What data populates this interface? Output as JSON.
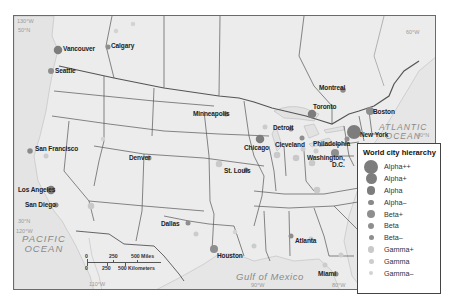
{
  "map": {
    "oceans": [
      {
        "id": "pacific",
        "line1": "PACIFIC",
        "line2": "OCEAN",
        "x": 8,
        "y": 228
      },
      {
        "id": "atlantic",
        "line1": "ATLANTIC",
        "line2": "OCEAN",
        "x": 383,
        "y": 119
      },
      {
        "id": "gulf",
        "line1": "Gulf of Mexico",
        "line2": "",
        "x": 222,
        "y": 265
      }
    ],
    "coordinates": [
      {
        "label": "130°W",
        "x": 16,
        "y": 18
      },
      {
        "label": "50°N",
        "x": 16,
        "y": 28
      },
      {
        "label": "30°N",
        "x": 16,
        "y": 220
      },
      {
        "label": "120°W",
        "x": 14,
        "y": 230
      },
      {
        "label": "110°W",
        "x": 88,
        "y": 282
      },
      {
        "label": "90°W",
        "x": 251,
        "y": 283
      },
      {
        "label": "80°W",
        "x": 333,
        "y": 283
      },
      {
        "label": "40°N",
        "x": 424,
        "y": 112
      },
      {
        "label": "60°W",
        "x": 406,
        "y": 28
      }
    ],
    "cities": [
      {
        "name": "Vancouver",
        "tier": "Alpha",
        "x": 57,
        "y": 49,
        "lx": 62,
        "ly": 45
      },
      {
        "name": "Calgary",
        "tier": "Beta-",
        "x": 107,
        "y": 46,
        "lx": 110,
        "ly": 42
      },
      {
        "name": "Seattle",
        "tier": "Beta",
        "x": 50,
        "y": 70,
        "lx": 54,
        "ly": 67
      },
      {
        "name": "San Francisco",
        "tier": "Alpha-",
        "x": 29,
        "y": 150,
        "lx": 34,
        "ly": 145
      },
      {
        "name": "Los Angeles",
        "tier": "Alpha",
        "x": 50,
        "y": 189,
        "lx": 17,
        "ly": 186
      },
      {
        "name": "San Diego",
        "tier": "Beta-",
        "x": 55,
        "y": 204,
        "lx": 24,
        "ly": 201
      },
      {
        "name": "Denver",
        "tier": "Beta-",
        "x": 148,
        "y": 157,
        "lx": 128,
        "ly": 154
      },
      {
        "name": "Minneapolis",
        "tier": "Beta-",
        "x": 225,
        "y": 113,
        "lx": 192,
        "ly": 110
      },
      {
        "name": "Chicago",
        "tier": "Alpha",
        "x": 259,
        "y": 138,
        "lx": 243,
        "ly": 144
      },
      {
        "name": "St. Louis",
        "tier": "Beta-",
        "x": 245,
        "y": 169,
        "lx": 223,
        "ly": 167
      },
      {
        "name": "Dallas",
        "tier": "Beta-",
        "x": 187,
        "y": 222,
        "lx": 160,
        "ly": 220
      },
      {
        "name": "Houston",
        "tier": "Beta+",
        "x": 213,
        "y": 248,
        "lx": 216,
        "ly": 252
      },
      {
        "name": "Atlanta",
        "tier": "Beta-",
        "x": 290,
        "y": 235,
        "lx": 294,
        "ly": 237
      },
      {
        "name": "Miami",
        "tier": "Beta-",
        "x": 335,
        "y": 273,
        "lx": 317,
        "ly": 270
      },
      {
        "name": "Detroit",
        "tier": "Beta-",
        "x": 290,
        "y": 128,
        "lx": 272,
        "ly": 124
      },
      {
        "name": "Cleveland",
        "tier": "Beta-",
        "x": 301,
        "y": 137,
        "lx": 274,
        "ly": 141
      },
      {
        "name": "Toronto",
        "tier": "Alpha",
        "x": 311,
        "y": 113,
        "lx": 312,
        "ly": 103
      },
      {
        "name": "Montreal",
        "tier": "Alpha-",
        "x": 342,
        "y": 89,
        "lx": 318,
        "ly": 84
      },
      {
        "name": "Boston",
        "tier": "Beta+",
        "x": 369,
        "y": 110,
        "lx": 372,
        "ly": 108
      },
      {
        "name": "New York",
        "tier": "Alpha++",
        "x": 353,
        "y": 131,
        "lx": 359,
        "ly": 131
      },
      {
        "name": "Philadelphia",
        "tier": "Beta-",
        "x": 346,
        "y": 138,
        "lx": 312,
        "ly": 140
      },
      {
        "name": "Washington, D.C.",
        "line1": "Washington,",
        "line2": "D.C.",
        "tier": "Beta+",
        "x": 334,
        "y": 152,
        "lx": 306,
        "ly": 154
      }
    ],
    "minor_dots": [
      {
        "x": 115,
        "y": 30,
        "tier": "Gamma-"
      },
      {
        "x": 132,
        "y": 23,
        "tier": "Gamma-"
      },
      {
        "x": 102,
        "y": 138,
        "tier": "Gamma-"
      },
      {
        "x": 90,
        "y": 205,
        "tier": "Gamma+"
      },
      {
        "x": 45,
        "y": 155,
        "tier": "Gamma"
      },
      {
        "x": 218,
        "y": 163,
        "tier": "Gamma+"
      },
      {
        "x": 264,
        "y": 126,
        "tier": "Gamma"
      },
      {
        "x": 276,
        "y": 154,
        "tier": "Gamma+"
      },
      {
        "x": 295,
        "y": 157,
        "tier": "Gamma+"
      },
      {
        "x": 302,
        "y": 148,
        "tier": "Gamma"
      },
      {
        "x": 311,
        "y": 162,
        "tier": "Gamma+"
      },
      {
        "x": 315,
        "y": 150,
        "tier": "Gamma"
      },
      {
        "x": 310,
        "y": 238,
        "tier": "Gamma"
      },
      {
        "x": 316,
        "y": 189,
        "tier": "Gamma+"
      },
      {
        "x": 324,
        "y": 264,
        "tier": "Gamma"
      },
      {
        "x": 195,
        "y": 233,
        "tier": "Gamma"
      },
      {
        "x": 253,
        "y": 245,
        "tier": "Gamma"
      },
      {
        "x": 340,
        "y": 254,
        "tier": "Gamma"
      },
      {
        "x": 234,
        "y": 231,
        "tier": "Gamma-"
      }
    ],
    "scale_bar": {
      "miles": [
        "0",
        "250",
        "500 Miles"
      ],
      "kilometers": [
        "0",
        "250",
        "500 Kilometers"
      ]
    }
  },
  "legend": {
    "title": "World city hierarchy",
    "items": [
      {
        "label": "Alpha++",
        "size": 14,
        "color": "#7d7d7d"
      },
      {
        "label": "Alpha+",
        "size": 11,
        "color": "#7d7d7d"
      },
      {
        "label": "Alpha",
        "size": 8.5,
        "color": "#7d7d7d"
      },
      {
        "label": "Alpha–",
        "size": 5.5,
        "color": "#8a8a8a"
      },
      {
        "label": "Beta+",
        "size": 8,
        "color": "#8e8e8e"
      },
      {
        "label": "Beta",
        "size": 6,
        "color": "#8e8e8e"
      },
      {
        "label": "Beta–",
        "size": 5,
        "color": "#8e8e8e"
      },
      {
        "label": "Gamma+",
        "size": 6.5,
        "color": "#c9c9c9"
      },
      {
        "label": "Gamma",
        "size": 5,
        "color": "#cccccc"
      },
      {
        "label": "Gamma–",
        "size": 4.5,
        "color": "#d3d3d3"
      }
    ]
  }
}
